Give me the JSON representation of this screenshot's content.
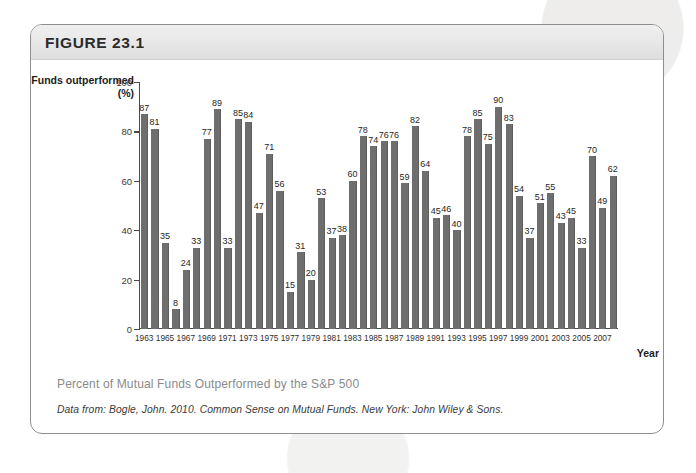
{
  "figure": {
    "label": "FIGURE 23.1",
    "caption": "Percent of Mutual Funds Outperformed by the S&P 500",
    "source": "Data from: Bogle, John. 2010. Common Sense on Mutual Funds. New York: John Wiley & Sons."
  },
  "chart_data": {
    "type": "bar",
    "title": "Percent of Mutual Funds Outperformed by the S&P 500",
    "xlabel": "Year",
    "ylabel": "Funds outperformed (%)",
    "ylim": [
      0,
      100
    ],
    "yticks": [
      0,
      20,
      40,
      60,
      80,
      100
    ],
    "grid": false,
    "legend": false,
    "bar_color": "#6e6e6e",
    "xtick_labels": [
      1963,
      1965,
      1967,
      1969,
      1971,
      1973,
      1975,
      1977,
      1979,
      1981,
      1983,
      1985,
      1987,
      1989,
      1991,
      1993,
      1995,
      1997,
      1999,
      2001,
      2003,
      2005,
      2007
    ],
    "categories": [
      1963,
      1964,
      1965,
      1966,
      1967,
      1968,
      1969,
      1970,
      1971,
      1972,
      1973,
      1974,
      1975,
      1976,
      1977,
      1978,
      1979,
      1980,
      1981,
      1982,
      1983,
      1984,
      1985,
      1986,
      1987,
      1988,
      1989,
      1990,
      1991,
      1992,
      1993,
      1994,
      1995,
      1996,
      1997,
      1998,
      1999,
      2000,
      2001,
      2002,
      2003,
      2004,
      2005,
      2006,
      2007,
      2008
    ],
    "values": [
      87,
      81,
      35,
      8,
      24,
      33,
      77,
      89,
      33,
      85,
      84,
      47,
      71,
      56,
      15,
      31,
      20,
      53,
      37,
      38,
      60,
      78,
      74,
      76,
      76,
      59,
      82,
      64,
      45,
      46,
      40,
      78,
      85,
      75,
      90,
      83,
      54,
      37,
      51,
      55,
      43,
      45,
      33,
      70,
      49,
      62
    ]
  }
}
